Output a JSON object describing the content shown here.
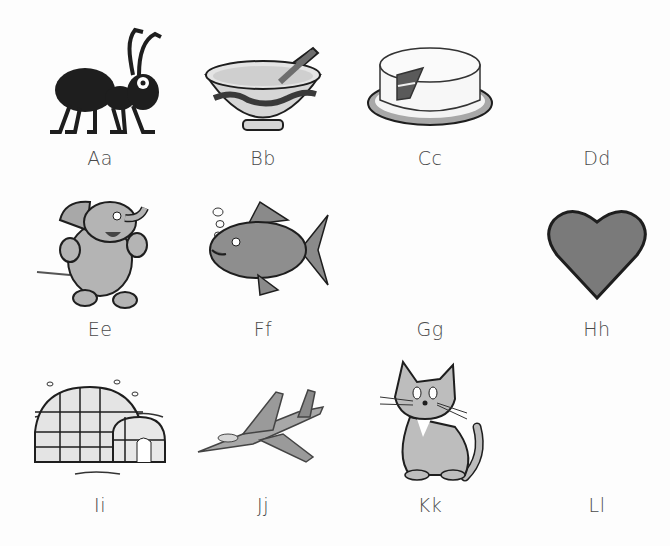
{
  "worksheet": {
    "items": [
      {
        "label": "Aa",
        "picture": "ant"
      },
      {
        "label": "Bb",
        "picture": "bowl"
      },
      {
        "label": "Cc",
        "picture": "cake"
      },
      {
        "label": "Dd",
        "picture": ""
      },
      {
        "label": "Ee",
        "picture": "elephant"
      },
      {
        "label": "Ff",
        "picture": "fish"
      },
      {
        "label": "Gg",
        "picture": ""
      },
      {
        "label": "Hh",
        "picture": "heart"
      },
      {
        "label": "Ii",
        "picture": "igloo"
      },
      {
        "label": "Jj",
        "picture": "jet"
      },
      {
        "label": "Kk",
        "picture": "kitten"
      },
      {
        "label": "Ll",
        "picture": ""
      }
    ],
    "colors": {
      "ink": "#1e1e1e",
      "fill_gray": "#a8a8a8",
      "dark_gray": "#6e6e6e",
      "light_gray": "#d6d6d6",
      "label": "#4a4a4a"
    }
  }
}
